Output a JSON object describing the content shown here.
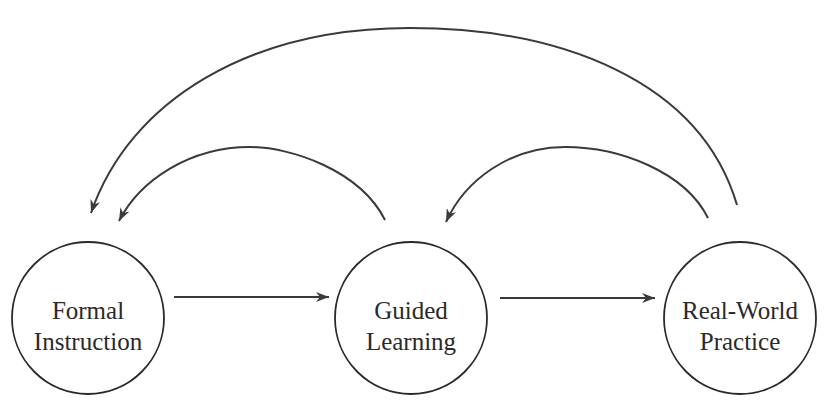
{
  "diagram": {
    "nodes": [
      {
        "id": "formal",
        "lines": [
          "Formal",
          "Instruction"
        ],
        "cx": 88,
        "cy": 318,
        "r": 76
      },
      {
        "id": "guided",
        "lines": [
          "Guided",
          "Learning"
        ],
        "cx": 411,
        "cy": 318,
        "r": 76
      },
      {
        "id": "practice",
        "lines": [
          "Real-World",
          "Practice"
        ],
        "cx": 740,
        "cy": 318,
        "r": 76
      }
    ],
    "edges": [
      {
        "from": "formal",
        "to": "guided",
        "type": "straight"
      },
      {
        "from": "guided",
        "to": "practice",
        "type": "straight"
      },
      {
        "from": "guided",
        "to": "formal",
        "type": "curved-feedback"
      },
      {
        "from": "practice",
        "to": "guided",
        "type": "curved-feedback"
      },
      {
        "from": "practice",
        "to": "formal",
        "type": "curved-feedback"
      }
    ],
    "colors": {
      "line": "#3a3a3a",
      "text": "#2a2a2a",
      "background": "#ffffff"
    }
  }
}
